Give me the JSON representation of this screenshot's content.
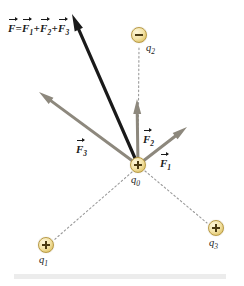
{
  "figure": {
    "background_color": "#ffffff",
    "width": 244,
    "height": 286
  },
  "colors": {
    "resultant_vector": "#1a1a1a",
    "component_vector": "#8d887d",
    "dashed_line": "#9a9a9a",
    "charge_fill": "#f3e3a8",
    "charge_border": "#b99b45",
    "charge_sign": "#4a3a12",
    "bottom_bar": "#ececec",
    "text": "#1b1b1b"
  },
  "formula": {
    "text": "F = F1 + F2 + F3",
    "parts": {
      "lhs": "F",
      "equals": "=",
      "term1": "F",
      "term1_sub": "1",
      "plus1": "+",
      "term2": "F",
      "term2_sub": "2",
      "plus2": "+",
      "term3": "F",
      "term3_sub": "3"
    }
  },
  "charges": [
    {
      "id": "q0",
      "name": "q",
      "subscript": "0",
      "sign": "+",
      "polarity": "positive",
      "x": 138,
      "y": 165,
      "radius": 8,
      "label_x": 131,
      "label_y": 174
    },
    {
      "id": "q2",
      "name": "q",
      "subscript": "2",
      "sign": "−",
      "polarity": "negative",
      "x": 139,
      "y": 35,
      "radius": 8,
      "label_x": 146,
      "label_y": 42
    },
    {
      "id": "q1",
      "name": "q",
      "subscript": "1",
      "sign": "+",
      "polarity": "positive",
      "x": 46,
      "y": 245,
      "radius": 8,
      "label_x": 39,
      "label_y": 254
    },
    {
      "id": "q3",
      "name": "q",
      "subscript": "3",
      "sign": "+",
      "polarity": "positive",
      "x": 216,
      "y": 228,
      "radius": 8,
      "label_x": 209,
      "label_y": 237
    }
  ],
  "vectors": [
    {
      "id": "F",
      "name": "F",
      "subscript": "",
      "kind": "resultant",
      "color": "#1a1a1a",
      "from_x": 138,
      "from_y": 165,
      "to_x": 72,
      "to_y": 14,
      "width": 3.2,
      "head_length": 17,
      "head_width": 9
    },
    {
      "id": "F3",
      "name": "F",
      "subscript": "3",
      "kind": "component",
      "color": "#8d887d",
      "from_x": 138,
      "from_y": 165,
      "to_x": 39,
      "to_y": 92,
      "width": 3.0,
      "head_length": 15,
      "head_width": 8,
      "label_x": 76,
      "label_y": 143
    },
    {
      "id": "F2",
      "name": "F",
      "subscript": "2",
      "kind": "component",
      "color": "#8d887d",
      "from_x": 138,
      "from_y": 165,
      "to_x": 137,
      "to_y": 99,
      "width": 3.0,
      "head_length": 15,
      "head_width": 8,
      "label_x": 143,
      "label_y": 133
    },
    {
      "id": "F1",
      "name": "F",
      "subscript": "1",
      "kind": "component",
      "color": "#8d887d",
      "from_x": 138,
      "from_y": 165,
      "to_x": 187,
      "to_y": 127,
      "width": 3.0,
      "head_length": 15,
      "head_width": 8,
      "label_x": 160,
      "label_y": 157
    }
  ],
  "dashed_lines": [
    {
      "id": "q0-q2",
      "from_x": 138,
      "from_y": 163,
      "to_x": 139,
      "to_y": 46
    },
    {
      "id": "q0-q1",
      "from_x": 132,
      "from_y": 172,
      "to_x": 54,
      "to_y": 240
    },
    {
      "id": "q0-q3",
      "from_x": 145,
      "from_y": 171,
      "to_x": 207,
      "to_y": 223
    }
  ]
}
